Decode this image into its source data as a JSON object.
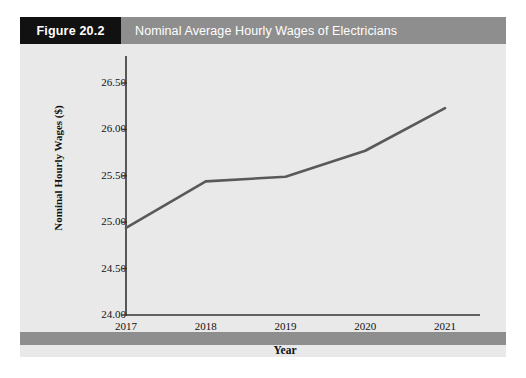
{
  "figure": {
    "number_label": "Figure 20.2",
    "title": "Nominal Average Hourly Wages of Electricians"
  },
  "colors": {
    "figure_number_box": "#111111",
    "title_bar": "#8e8e8e",
    "footer_bar": "#8e8e8e",
    "plot_background": "#e9e9e9",
    "line": "#595959",
    "axis": "#333333",
    "text": "#111111"
  },
  "chart_data": {
    "type": "line",
    "title": "Nominal Average Hourly Wages of Electricians",
    "xlabel": "Year",
    "ylabel": "Nominal Hourly Wages ($)",
    "categories": [
      "2017",
      "2018",
      "2019",
      "2020",
      "2021"
    ],
    "x": [
      2017,
      2018,
      2019,
      2020,
      2021
    ],
    "values": [
      24.94,
      25.44,
      25.49,
      25.77,
      26.23
    ],
    "series": [
      {
        "name": "Nominal Hourly Wages ($)",
        "values": [
          24.94,
          25.44,
          25.49,
          25.77,
          26.23
        ]
      }
    ],
    "ylim": [
      24.0,
      26.5
    ],
    "xlim": [
      2017,
      2021
    ],
    "yticks": [
      "24.00",
      "24.50",
      "25.00",
      "25.50",
      "26.00",
      "26.50"
    ],
    "ytick_values": [
      24.0,
      24.5,
      25.0,
      25.5,
      26.0,
      26.5
    ],
    "xticks": [
      "2017",
      "2018",
      "2019",
      "2020",
      "2021"
    ],
    "grid": false,
    "legend": false,
    "legend_position": "none",
    "markers": false
  }
}
